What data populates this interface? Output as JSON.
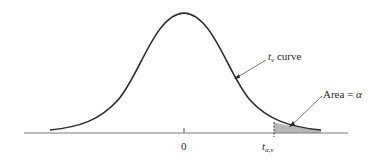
{
  "figure": {
    "type": "t-distribution curve with upper tail area",
    "curve_label": {
      "italic": "t",
      "subscript": "ν",
      "rest": " curve"
    },
    "area_label": {
      "text": "Area = ",
      "symbol": "α"
    },
    "axis_ticks": [
      {
        "label": "0",
        "italic": false
      },
      {
        "label": "t",
        "subscript": "α,ν",
        "italic": true
      }
    ],
    "colors": {
      "curve": "#2a2a2a",
      "axis": "#7a7a7a",
      "shade": "#b8b8b8",
      "text": "#2a2a2a"
    }
  }
}
